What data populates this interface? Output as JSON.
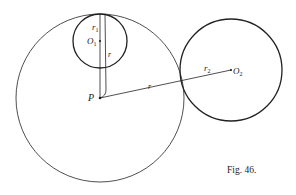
{
  "figure": {
    "caption": "Fig. 46.",
    "labels": {
      "P": "P",
      "O1": "O",
      "O1_sub": "1",
      "O2": "O",
      "O2_sub": "2",
      "r1": "r",
      "r1_sub": "1",
      "r2": "r",
      "r2_sub": "2",
      "r_vertical": "r",
      "r_slant": "r"
    },
    "colors": {
      "stroke": "#222222",
      "background": "#ffffff"
    }
  }
}
